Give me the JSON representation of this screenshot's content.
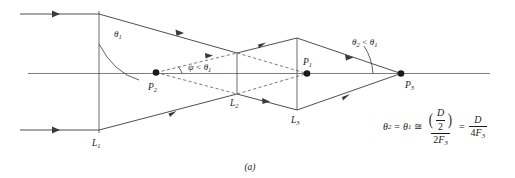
{
  "figure": {
    "caption": "(a)",
    "points": [
      {
        "name": "P1",
        "label": "P",
        "sub": "1",
        "x": 307,
        "y": 73.5
      },
      {
        "name": "P2",
        "label": "P",
        "sub": "2",
        "x": 156,
        "y": 72.5
      },
      {
        "name": "P3",
        "label": "P",
        "sub": "3",
        "x": 401,
        "y": 73.5
      }
    ],
    "lenses": [
      {
        "name": "L1",
        "label": "L",
        "sub": "1",
        "x": 99
      },
      {
        "name": "L2",
        "label": "L",
        "sub": "2",
        "x": 237
      },
      {
        "name": "L3",
        "label": "L",
        "sub": "3",
        "x": 297
      }
    ],
    "angles": [
      {
        "name": "theta1",
        "label": "θ",
        "sub": "1"
      },
      {
        "name": "psi-lt-theta1",
        "label": "ψ",
        "relation": "<",
        "label2": "θ",
        "sub2": "1"
      },
      {
        "name": "theta2-lt-theta1",
        "label": "θ",
        "sub": "2",
        "relation": "<",
        "label2": "θ",
        "sub2": "1"
      }
    ],
    "formula": {
      "lhs_symbol": "θ",
      "lhs_sub": "2",
      "eq1": "=",
      "mid_symbol": "θ",
      "mid_sub": "1",
      "eq2": "≅",
      "frac1_num_symbol": "D",
      "frac1_num_den": "2",
      "frac1_den_coeff": "2",
      "frac1_den_symbol": "F",
      "frac1_den_sub": "3",
      "eq3": "=",
      "frac2_num": "D",
      "frac2_den_coeff": "4",
      "frac2_den_symbol": "F",
      "frac2_den_sub": "3"
    },
    "colors": {
      "ink": "#1b1b1b",
      "ray": "#3a3a3a",
      "axis": "#6d6d6d",
      "dashed": "#5a5a5a",
      "background": "#ffffff"
    }
  }
}
